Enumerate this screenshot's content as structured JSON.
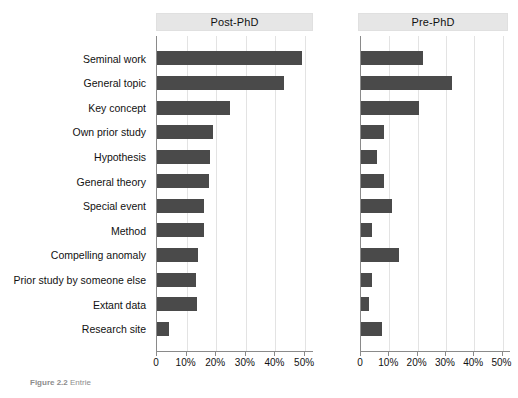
{
  "figure": {
    "caption_label": "Figure 2.2",
    "caption_text": "Entrie"
  },
  "panels": [
    {
      "key": "post",
      "title": "Post-PhD"
    },
    {
      "key": "pre",
      "title": "Pre-PhD"
    }
  ],
  "axis": {
    "tick_labels": [
      "0",
      "10%",
      "20%",
      "30%",
      "40%",
      "50%"
    ],
    "tick_values": [
      0,
      10,
      20,
      30,
      40,
      50
    ]
  },
  "colors": {
    "bar": "#4a4a4a",
    "header_strip": "#e6e6e6",
    "gridline": "#e3e3e3",
    "axis": "#8a8a8a"
  },
  "chart_data": {
    "type": "bar",
    "orientation": "horizontal",
    "title": "",
    "xlabel": "",
    "ylabel": "",
    "xlim": [
      0,
      53
    ],
    "grid": true,
    "legend": "none",
    "facets": [
      "Post-PhD",
      "Pre-PhD"
    ],
    "categories": [
      "Seminal work",
      "General topic",
      "Key concept",
      "Own prior study",
      "Hypothesis",
      "General theory",
      "Special event",
      "Method",
      "Compelling anomaly",
      "Prior study by someone else",
      "Extant data",
      "Research site"
    ],
    "series": [
      {
        "name": "Post-PhD",
        "values": [
          49,
          43,
          24.5,
          19,
          18,
          17.5,
          16,
          16,
          14,
          13,
          13.5,
          4
        ]
      },
      {
        "name": "Pre-PhD",
        "values": [
          22,
          32,
          20.5,
          8,
          5.5,
          8,
          11,
          4,
          13.5,
          4,
          3,
          7.5
        ]
      }
    ]
  }
}
